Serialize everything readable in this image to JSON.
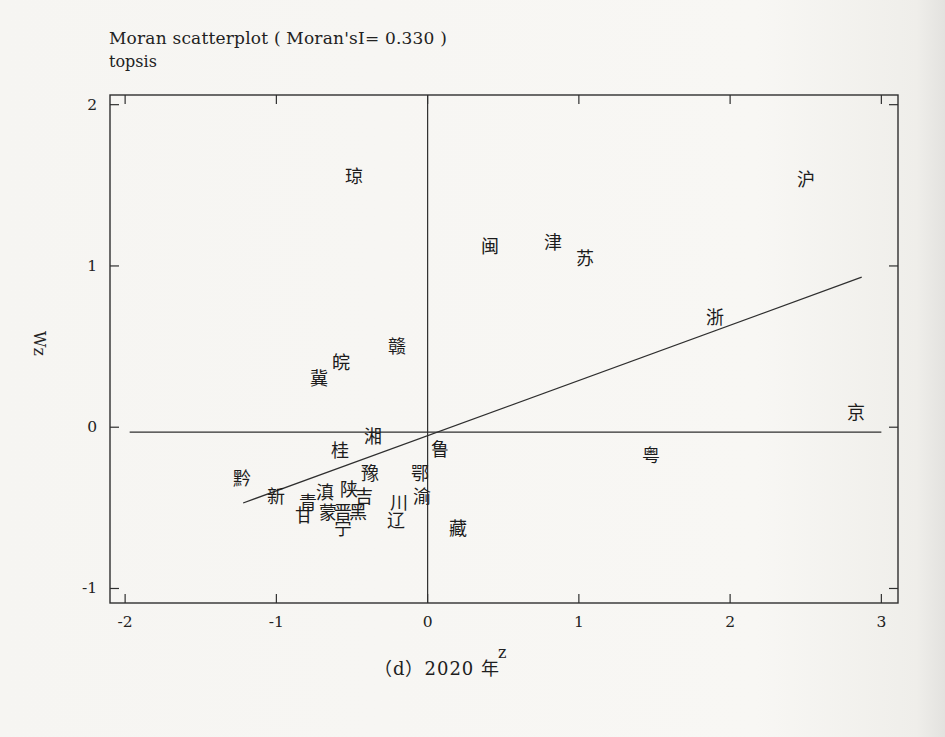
{
  "figure": {
    "title": "Moran scatterplot ( Moran'sI= 0.330 )",
    "subtitle": "topsis",
    "caption": "（d）2020 年"
  },
  "chart_data": {
    "type": "scatter",
    "title": "Moran scatterplot ( Moran'sI= 0.330 )",
    "subtitle": "topsis",
    "xlabel": "z",
    "ylabel": "Wz",
    "moran_i": 0.33,
    "year_caption": "（d）2020 年",
    "xlim": [
      -2.1,
      3.11
    ],
    "ylim": [
      -1.09,
      2.06
    ],
    "x_ticks": [
      -2,
      -1,
      0,
      1,
      2,
      3
    ],
    "y_ticks": [
      -1,
      0,
      1,
      2
    ],
    "grid": false,
    "point_marker": "text-label",
    "points": [
      {
        "label": "琼",
        "name": "hainan",
        "z": -0.49,
        "wz": 1.55
      },
      {
        "label": "沪",
        "name": "shanghai",
        "z": 2.5,
        "wz": 1.53
      },
      {
        "label": "闽",
        "name": "fujian",
        "z": 0.41,
        "wz": 1.12
      },
      {
        "label": "津",
        "name": "tianjin",
        "z": 0.83,
        "wz": 1.14
      },
      {
        "label": "苏",
        "name": "jiangsu",
        "z": 1.04,
        "wz": 1.04
      },
      {
        "label": "浙",
        "name": "zhejiang",
        "z": 1.9,
        "wz": 0.68
      },
      {
        "label": "京",
        "name": "beijing",
        "z": 2.83,
        "wz": 0.09
      },
      {
        "label": "粤",
        "name": "guangdong",
        "z": 1.48,
        "wz": -0.18
      },
      {
        "label": "赣",
        "name": "jiangxi",
        "z": -0.2,
        "wz": 0.5
      },
      {
        "label": "皖",
        "name": "anhui",
        "z": -0.57,
        "wz": 0.4
      },
      {
        "label": "冀",
        "name": "hebei",
        "z": -0.72,
        "wz": 0.3
      },
      {
        "label": "湘",
        "name": "hunan",
        "z": -0.36,
        "wz": -0.06
      },
      {
        "label": "桂",
        "name": "guangxi",
        "z": -0.58,
        "wz": -0.15
      },
      {
        "label": "鲁",
        "name": "shandong",
        "z": 0.08,
        "wz": -0.14
      },
      {
        "label": "鄂",
        "name": "hubei",
        "z": -0.05,
        "wz": -0.29
      },
      {
        "label": "黔",
        "name": "guizhou",
        "z": -1.23,
        "wz": -0.32
      },
      {
        "label": "豫",
        "name": "henan",
        "z": -0.38,
        "wz": -0.29
      },
      {
        "label": "新",
        "name": "xinjiang",
        "z": -1.0,
        "wz": -0.43
      },
      {
        "label": "陕",
        "name": "shaanxi",
        "z": -0.52,
        "wz": -0.39
      },
      {
        "label": "滇",
        "name": "yunnan",
        "z": -0.68,
        "wz": -0.41
      },
      {
        "label": "吉",
        "name": "jilin",
        "z": -0.42,
        "wz": -0.43
      },
      {
        "label": "渝",
        "name": "chongqing",
        "z": -0.04,
        "wz": -0.43
      },
      {
        "label": "青",
        "name": "qinghai",
        "z": -0.79,
        "wz": -0.47
      },
      {
        "label": "川",
        "name": "sichuan",
        "z": -0.19,
        "wz": -0.47
      },
      {
        "label": "蒙",
        "name": "inner-mongolia",
        "z": -0.66,
        "wz": -0.53
      },
      {
        "label": "晋",
        "name": "shanxi",
        "z": -0.56,
        "wz": -0.53
      },
      {
        "label": "黑",
        "name": "heilongjiang",
        "z": -0.46,
        "wz": -0.53
      },
      {
        "label": "甘",
        "name": "gansu",
        "z": -0.82,
        "wz": -0.55
      },
      {
        "label": "辽",
        "name": "liaoning",
        "z": -0.21,
        "wz": -0.58
      },
      {
        "label": "宁",
        "name": "ningxia",
        "z": -0.56,
        "wz": -0.63
      },
      {
        "label": "藏",
        "name": "tibet",
        "z": 0.2,
        "wz": -0.63
      }
    ],
    "lines": {
      "vertical_zero": {
        "x": 0
      },
      "horizontal_mean": {
        "y": -0.03,
        "x1": -1.97,
        "x2": 3.0
      },
      "regression": {
        "x1": -1.22,
        "y1": -0.47,
        "x2": 2.87,
        "y2": 0.93
      }
    },
    "ink_color": "#2f2f2f",
    "background_color": "#f7f6f3"
  }
}
